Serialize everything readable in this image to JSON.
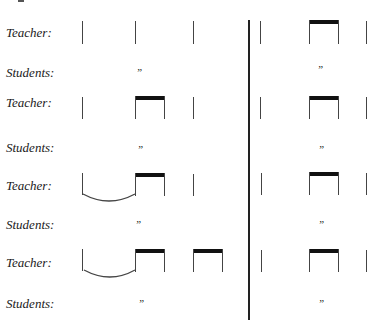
{
  "labels": {
    "teacher": "Teacher:",
    "students": "Students:",
    "ditto": "”"
  },
  "rows": [
    {
      "role": "Teacher",
      "left": [
        "quarter",
        "quarter",
        "quarter"
      ],
      "right": [
        "quarter",
        "eighth-pair",
        "quarter"
      ]
    },
    {
      "role": "Students",
      "left": "ditto",
      "right": "ditto"
    },
    {
      "role": "Teacher",
      "left": [
        "quarter",
        "eighth-pair",
        "quarter"
      ],
      "right": [
        "quarter",
        "eighth-pair",
        "quarter"
      ]
    },
    {
      "role": "Students",
      "left": "ditto",
      "right": "ditto"
    },
    {
      "role": "Teacher",
      "left": [
        "half-tied",
        "eighth",
        "quarter"
      ],
      "right": [
        "quarter",
        "eighth-pair",
        "quarter"
      ]
    },
    {
      "role": "Students",
      "left": "ditto",
      "right": "ditto"
    },
    {
      "role": "Teacher",
      "left": [
        "half-tied",
        "eighth",
        "eighth-pair"
      ],
      "right": [
        "quarter",
        "eighth-pair",
        "quarter"
      ]
    },
    {
      "role": "Students",
      "left": "ditto",
      "right": "ditto"
    }
  ]
}
